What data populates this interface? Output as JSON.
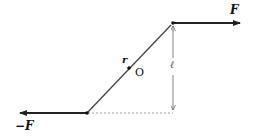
{
  "diagram": {
    "labels": {
      "force_right": "F",
      "force_left": "−F",
      "position_vector": "r",
      "origin": "O",
      "separation": "ℓ"
    },
    "colors": {
      "line": "#222222",
      "rod": "#444444",
      "dashed": "#888888"
    }
  }
}
